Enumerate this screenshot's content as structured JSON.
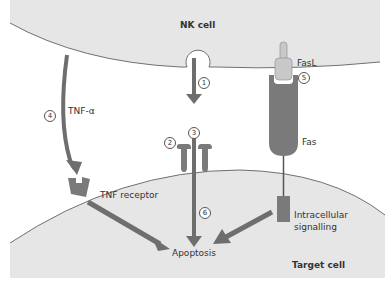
{
  "diagram": {
    "colors": {
      "cell_fill": "#e6e6e6",
      "cell_border": "#707070",
      "arrow": "#6e6e6e",
      "receptor": "#7a7a7a",
      "fasl_fill": "#c8c8c8",
      "background": "#ffffff"
    },
    "cells": {
      "nk_cell": "NK cell",
      "target_cell": "Target cell"
    },
    "labels": {
      "tnf_alpha": "TNF-α",
      "tnf_receptor": "TNF receptor",
      "fasl": "FasL",
      "fas": "Fas",
      "intracellular_line1": "Intracellular",
      "intracellular_line2": "signalling",
      "apoptosis": "Apoptosis"
    },
    "steps": [
      "1",
      "2",
      "3",
      "4",
      "5",
      "6"
    ]
  }
}
